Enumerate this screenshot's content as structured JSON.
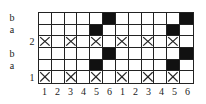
{
  "row_labels": [
    {
      "text": "b",
      "x": 6,
      "row": 0
    },
    {
      "text": "a",
      "x": 6,
      "row": 1
    },
    {
      "text": "2",
      "x": 26,
      "row": 2
    },
    {
      "text": "b",
      "x": 6,
      "row": 3
    },
    {
      "text": "a",
      "x": 6,
      "row": 4
    },
    {
      "text": "1",
      "x": 26,
      "row": 5
    }
  ],
  "column_labels": [
    "1",
    "2",
    "3",
    "4",
    "5",
    "6",
    "1",
    "2",
    "3",
    "4",
    "5",
    "6"
  ],
  "grid": {
    "rows": 6,
    "cols": 12,
    "cells": [
      [
        "",
        "",
        "",
        "",
        "",
        "B",
        "",
        "",
        "",
        "",
        "",
        "B"
      ],
      [
        "",
        "",
        "",
        "",
        "B",
        "",
        "",
        "",
        "",
        "",
        "B",
        ""
      ],
      [
        "X",
        "",
        "X",
        "",
        "X",
        "",
        "X",
        "",
        "X",
        "",
        "X",
        ""
      ],
      [
        "",
        "",
        "",
        "",
        "",
        "B",
        "",
        "",
        "",
        "",
        "",
        "B"
      ],
      [
        "",
        "",
        "",
        "",
        "B",
        "",
        "",
        "",
        "",
        "",
        "B",
        ""
      ],
      [
        "X",
        "",
        "X",
        "",
        "X",
        "",
        "X",
        "",
        "X",
        "",
        "X",
        ""
      ]
    ]
  },
  "colors": {
    "filled": "#111111",
    "line": "#222222"
  }
}
